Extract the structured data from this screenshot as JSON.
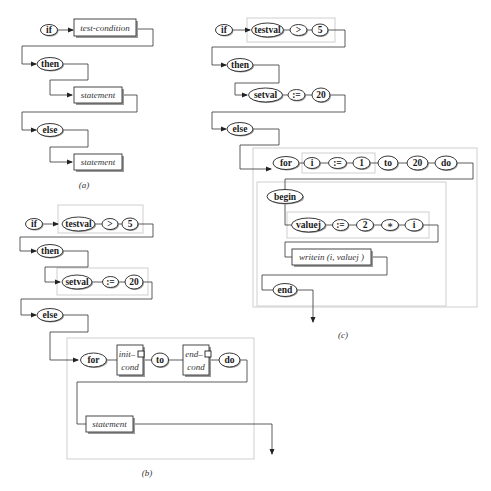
{
  "diagrams": {
    "a": {
      "caption": "(a)",
      "nodes": {
        "if": "if",
        "test_condition": "test-condition",
        "then": "then",
        "then_statement": "statement",
        "else": "else",
        "else_statement": "statement"
      }
    },
    "b": {
      "caption": "(b)",
      "nodes": {
        "if": "if",
        "testval": "testval",
        "gt": ">",
        "five": "5",
        "then": "then",
        "setval": "setval",
        "assign": ":=",
        "twenty": "20",
        "else": "else",
        "for": "for",
        "init_cond_1": "init–",
        "init_cond_2": "cond",
        "to": "to",
        "end_cond_1": "end–",
        "end_cond_2": "cond",
        "do": "do",
        "statement": "statement"
      }
    },
    "c": {
      "caption": "(c)",
      "nodes": {
        "if": "if",
        "testval": "testval",
        "gt": ">",
        "five": "5",
        "then": "then",
        "setval": "setval",
        "assign": ":=",
        "twenty": "20",
        "else": "else",
        "for": "for",
        "i": "i",
        "for_assign": ":=",
        "one": "1",
        "to": "to",
        "to_twenty": "20",
        "do": "do",
        "begin": "begin",
        "valuej": "valuej",
        "val_assign": ":=",
        "two": "2",
        "times": "∗",
        "i2": "i",
        "writein": "writein (i, valuej )",
        "end": "end"
      }
    }
  },
  "colors": {
    "line": "#333333",
    "group_border": "#cfcfcf",
    "shadow": "#9a9a9a",
    "background": "#ffffff"
  }
}
